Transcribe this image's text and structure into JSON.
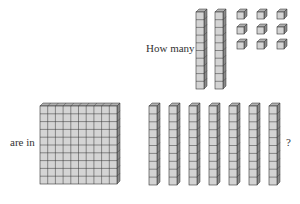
{
  "question": {
    "line1": "How many",
    "line2": "are in",
    "end": "?"
  },
  "top_group": {
    "tens_rods": 2,
    "units": 9
  },
  "bottom_group": {
    "flats": 1,
    "tens_rods": 7
  },
  "colors": {
    "face": "#d4d4d4",
    "side": "#8a8a8a",
    "top": "#b0b0b0",
    "line": "#333333"
  }
}
